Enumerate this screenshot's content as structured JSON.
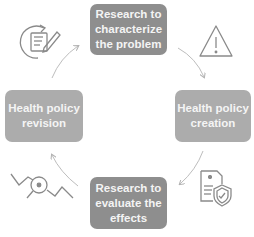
{
  "diagram": {
    "type": "cycle",
    "steps": [
      {
        "id": "top",
        "lines": [
          "Research to",
          "characterize",
          "the problem"
        ]
      },
      {
        "id": "right",
        "lines": [
          "Health policy",
          "creation"
        ]
      },
      {
        "id": "bottom",
        "lines": [
          "Research to",
          "evaluate the",
          "effects"
        ]
      },
      {
        "id": "left",
        "lines": [
          "Health policy",
          "revision"
        ]
      }
    ],
    "icons": {
      "top_left": "document-edit-cycle-icon",
      "top_right": "warning-triangle-icon",
      "bottom_right": "medical-document-shield-icon",
      "bottom_left": "chart-magnifier-icon"
    },
    "colors": {
      "box_dark": "#8e8e8e",
      "box_light": "#acacac",
      "text": "#f4f4f4",
      "icon": "#8a8a8a",
      "arrow": "#b5b5b5"
    }
  }
}
